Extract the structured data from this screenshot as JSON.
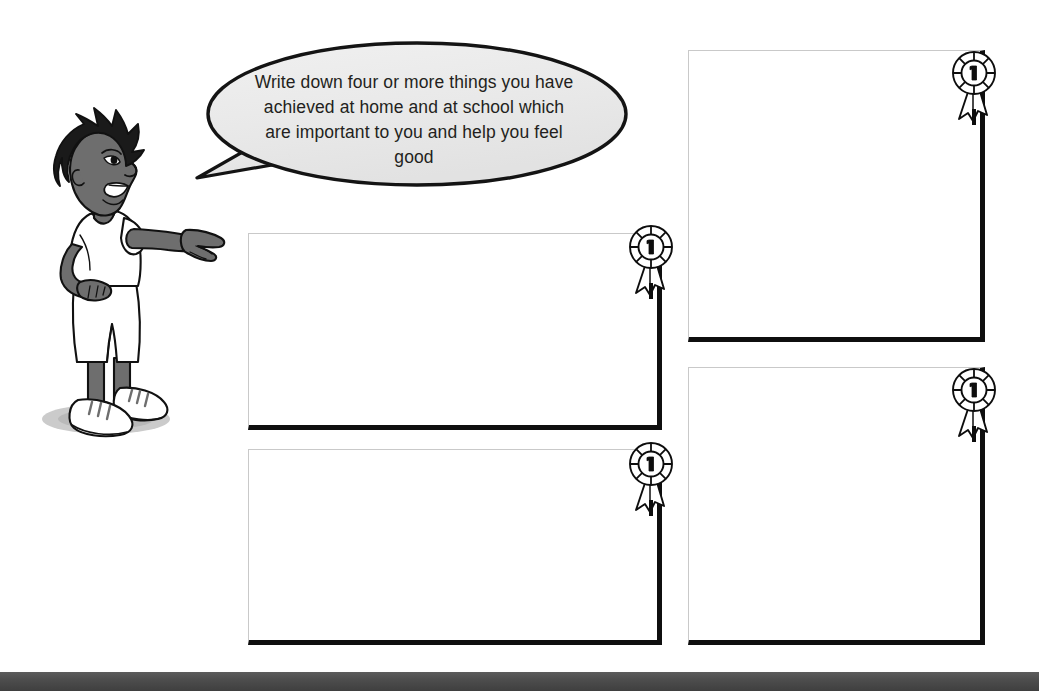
{
  "page": {
    "background_color": "#ffffff"
  },
  "character": {
    "name": "pointing-boy-illustration",
    "description": "Cartoon boy in profile facing right, pointing with his right arm toward the speech bubble and boxes",
    "hair_color": "#1a1a1a",
    "skin_color": "#6e6e6e",
    "clothing_color": "#ffffff",
    "shoe_color": "#ffffff",
    "shadow_color": "#bdbdbd"
  },
  "speech_bubble": {
    "text": "Write down four or more things you have achieved at home and at school which are important to you and help you feel good",
    "fill_color": "#e9e9e9",
    "outline_color": "#1a1a1a",
    "text_color": "#231f20"
  },
  "answer_boxes": [
    {
      "id": "box-1",
      "label": "Achievement box 1",
      "value": "",
      "placeholder": "",
      "border_color": "#0f0f0f",
      "hairline_color": "#c9c9c9"
    },
    {
      "id": "box-2",
      "label": "Achievement box 2",
      "value": "",
      "placeholder": "",
      "border_color": "#0f0f0f",
      "hairline_color": "#c9c9c9"
    },
    {
      "id": "box-3",
      "label": "Achievement box 3",
      "value": "",
      "placeholder": "",
      "border_color": "#0f0f0f",
      "hairline_color": "#c9c9c9"
    },
    {
      "id": "box-4",
      "label": "Achievement box 4",
      "value": "",
      "placeholder": "",
      "border_color": "#0f0f0f",
      "hairline_color": "#c9c9c9"
    }
  ],
  "rosettes": [
    {
      "id": "rosette-1",
      "icon": "award-rosette-icon",
      "numeral": "1"
    },
    {
      "id": "rosette-2",
      "icon": "award-rosette-icon",
      "numeral": "1"
    },
    {
      "id": "rosette-3",
      "icon": "award-rosette-icon",
      "numeral": "1"
    },
    {
      "id": "rosette-4",
      "icon": "award-rosette-icon",
      "numeral": "1"
    }
  ],
  "bottom_band": {
    "color": "#4c4c4c"
  }
}
